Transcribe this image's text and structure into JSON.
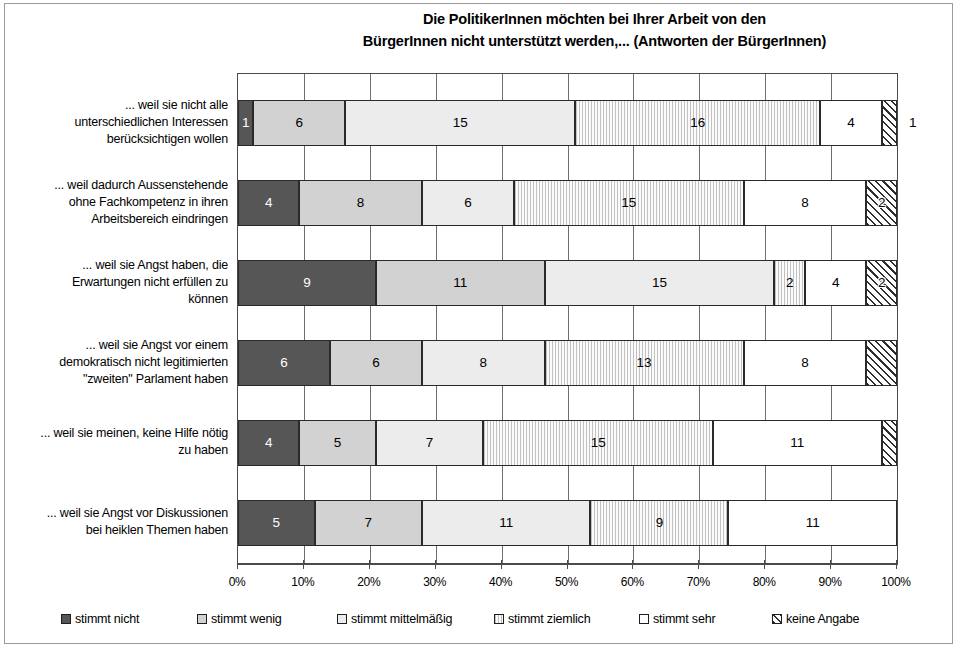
{
  "chart_data": {
    "type": "bar",
    "orientation": "horizontal",
    "stacked": true,
    "normalized_axis": true,
    "title": "Die PolitikerInnen möchten bei Ihrer Arbeit von den BürgerInnen nicht unterstützt werden,... (Antworten der BürgerInnen)",
    "title_lines": [
      "Die PolitikerInnen möchten bei Ihrer Arbeit von den",
      "BürgerInnen nicht unterstützt werden,... (Antworten der BürgerInnen)"
    ],
    "xlabel": "",
    "ylabel": "",
    "xlim": [
      0,
      100
    ],
    "x_tick_labels": [
      "0%",
      "10%",
      "20%",
      "30%",
      "40%",
      "50%",
      "60%",
      "70%",
      "80%",
      "90%",
      "100%"
    ],
    "x_tick_values": [
      0,
      10,
      20,
      30,
      40,
      50,
      60,
      70,
      80,
      90,
      100
    ],
    "grid": "vertical",
    "legend_position": "bottom",
    "categories": [
      "... weil sie nicht alle unterschiedlichen Interessen berücksichtigen wollen",
      "... weil dadurch Aussenstehende ohne Fachkompetenz in ihren Arbeitsbereich eindringen",
      "... weil sie Angst haben, die Erwartungen nicht erfüllen zu können",
      "... weil sie Angst vor einem demokratisch nicht legitimierten \"zweiten\" Parlament haben",
      "... weil sie meinen, keine Hilfe nötig zu haben",
      "... weil sie Angst vor Diskussionen bei heiklen Themen haben"
    ],
    "category_lines": [
      [
        "... weil sie nicht alle",
        "unterschiedlichen Interessen",
        "berücksichtigen wollen"
      ],
      [
        "... weil dadurch Aussenstehende",
        "ohne Fachkompetenz in ihren",
        "Arbeitsbereich eindringen"
      ],
      [
        "... weil sie Angst haben, die",
        "Erwartungen nicht erfüllen zu",
        "können"
      ],
      [
        "... weil sie Angst vor einem",
        "demokratisch nicht legitimierten",
        "\"zweiten\" Parlament haben"
      ],
      [
        "... weil sie meinen, keine Hilfe nötig",
        "zu haben"
      ],
      [
        "... weil sie Angst vor Diskussionen",
        "bei heiklen Themen haben"
      ]
    ],
    "series": [
      {
        "name": "stimmt nicht",
        "fill": "solid-dark-gray",
        "color": "#565656",
        "values": [
          1,
          4,
          9,
          6,
          4,
          5
        ]
      },
      {
        "name": "stimmt wenig",
        "fill": "dotted-light-gray",
        "color": "#d2d2d2",
        "values": [
          6,
          8,
          11,
          6,
          5,
          7
        ]
      },
      {
        "name": "stimmt mittelmäßig",
        "fill": "fine-dot-pale",
        "color": "#ececec",
        "values": [
          15,
          6,
          15,
          8,
          7,
          11
        ]
      },
      {
        "name": "stimmt ziemlich",
        "fill": "vertical-lines",
        "color": "#fbfbfb",
        "values": [
          16,
          15,
          2,
          13,
          15,
          9
        ]
      },
      {
        "name": "stimmt sehr",
        "fill": "white",
        "color": "#ffffff",
        "values": [
          4,
          8,
          4,
          8,
          11,
          11
        ]
      },
      {
        "name": "keine Angabe",
        "fill": "diagonal-hatch",
        "color": "#ffffff",
        "values": [
          1,
          2,
          2,
          2,
          1,
          0
        ]
      }
    ],
    "row_totals": [
      43,
      43,
      43,
      43,
      43,
      43
    ],
    "value_label_outside": [
      {
        "row": 0,
        "series": 5,
        "value": 1
      }
    ],
    "value_label_hidden": [
      {
        "row": 3,
        "series": 5
      },
      {
        "row": 4,
        "series": 5
      }
    ]
  },
  "legend": {
    "items": [
      {
        "label": "stimmt nicht"
      },
      {
        "label": "stimmt wenig"
      },
      {
        "label": "stimmt mittelmäßig"
      },
      {
        "label": "stimmt ziemlich"
      },
      {
        "label": "stimmt sehr"
      },
      {
        "label": "keine Angabe"
      }
    ]
  }
}
